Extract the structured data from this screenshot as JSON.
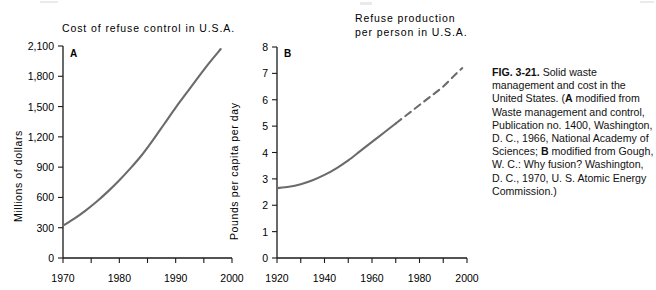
{
  "figure": {
    "caption_label": "FIG. 3-21.",
    "caption_text": " Solid waste management and cost in the United States. (",
    "caption_a_marker": "A",
    "caption_a_text": " modified from Waste management and control, Publication no. 1400, Washington, D. C., 1966, National Academy of Sciences; ",
    "caption_b_marker": "B",
    "caption_b_text": " modified from Gough, W. C.: Why fusion? Washington, D. C., 1970, U. S. Atomic Energy Commission.)"
  },
  "chart_data": [
    {
      "id": "A",
      "type": "line",
      "panel_letter": "A",
      "title": "Cost  of  refuse  control  in  U.S.A.",
      "xlabel": "",
      "ylabel": "Millions  of  dollars",
      "xlim": [
        1970,
        2000
      ],
      "ylim": [
        0,
        2100
      ],
      "xticks": [
        1970,
        1975,
        1980,
        1985,
        1990,
        1995,
        2000
      ],
      "xtick_labels": [
        "1970",
        "",
        "1980",
        "",
        "1990",
        "",
        "2000"
      ],
      "yticks": [
        0,
        300,
        600,
        900,
        1200,
        1500,
        1800,
        2100
      ],
      "ytick_labels": [
        "0",
        "300",
        "600",
        "900",
        "1,200",
        "1,500",
        "1,800",
        "2,100"
      ],
      "grid": false,
      "legend": "none",
      "series": [
        {
          "name": "Cost of refuse control",
          "style": "solid",
          "color": "#6b6b6b",
          "x": [
            1970,
            1972,
            1974,
            1976,
            1978,
            1980,
            1982,
            1984,
            1986,
            1988,
            1990,
            1992,
            1994,
            1996,
            1998
          ],
          "values": [
            320,
            390,
            470,
            560,
            660,
            770,
            890,
            1020,
            1170,
            1330,
            1490,
            1640,
            1790,
            1935,
            2070
          ]
        }
      ]
    },
    {
      "id": "B",
      "type": "line",
      "panel_letter": "B",
      "title": "Refuse  production\nper  person  in  U.S.A.",
      "xlabel": "",
      "ylabel": "Pounds  per  capita  per  day",
      "xlim": [
        1920,
        2000
      ],
      "ylim": [
        0,
        8
      ],
      "xticks": [
        1920,
        1930,
        1940,
        1950,
        1960,
        1970,
        1980,
        1990,
        2000
      ],
      "xtick_labels": [
        "1920",
        "",
        "1940",
        "",
        "1960",
        "",
        "1980",
        "",
        "2000"
      ],
      "yticks": [
        0,
        1,
        2,
        3,
        4,
        5,
        6,
        7,
        8
      ],
      "ytick_labels": [
        "0",
        "1",
        "2",
        "3",
        "4",
        "5",
        "6",
        "7",
        "8"
      ],
      "grid": false,
      "legend": "none",
      "series": [
        {
          "name": "Refuse production per person (observed)",
          "style": "solid",
          "color": "#6b6b6b",
          "x": [
            1920,
            1925,
            1930,
            1935,
            1940,
            1945,
            1950,
            1955,
            1960,
            1965,
            1970
          ],
          "values": [
            2.65,
            2.7,
            2.8,
            2.95,
            3.15,
            3.4,
            3.7,
            4.05,
            4.4,
            4.75,
            5.1
          ]
        },
        {
          "name": "Refuse production per person (projected)",
          "style": "dashed",
          "color": "#6b6b6b",
          "x": [
            1970,
            1975,
            1980,
            1985,
            1990,
            1995,
            1998
          ],
          "values": [
            5.1,
            5.45,
            5.8,
            6.15,
            6.5,
            6.95,
            7.2
          ]
        }
      ]
    }
  ]
}
